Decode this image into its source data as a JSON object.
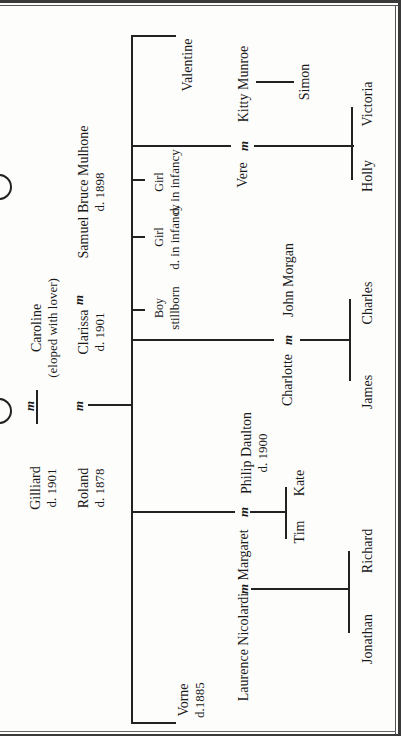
{
  "diagram": {
    "type": "family-tree",
    "orientation": "rotated-90-ccw",
    "marriage_symbol": "m",
    "generation_1": {
      "gilliard": {
        "name": "Gilliard",
        "note": "d. 1901"
      },
      "caroline": {
        "name": "Caroline",
        "note": "(eloped with lover)"
      },
      "roland": {
        "name": "Roland",
        "note": "d. 1878"
      },
      "clarissa": {
        "name": "Clarissa",
        "note": "d. 1901"
      },
      "samuel": {
        "name": "Samuel Bruce Mulhone",
        "note": "d. 1898"
      }
    },
    "generation_2": {
      "valentine": {
        "name": "Valentine"
      },
      "vere": {
        "name": "Vere"
      },
      "kitty": {
        "name": "Kitty Munroe"
      },
      "girl2": {
        "name": "Girl",
        "note": "d. in infancy"
      },
      "girl1": {
        "name": "Girl",
        "note": "d. in infancy"
      },
      "boy": {
        "name": "Boy",
        "note": "stillborn"
      },
      "charlotte": {
        "name": "Charlotte"
      },
      "john": {
        "name": "John Morgan"
      },
      "margaret": {
        "name": "Margaret"
      },
      "philip": {
        "name": "Philip Daulton",
        "note": "d. 1900"
      },
      "laurence": {
        "name": "Laurence Nicolardi"
      },
      "vorne": {
        "name": "Vorne",
        "note": "d.1885"
      }
    },
    "generation_3": {
      "simon": {
        "name": "Simon"
      },
      "victoria": {
        "name": "Victoria"
      },
      "holly": {
        "name": "Holly"
      },
      "charles": {
        "name": "Charles"
      },
      "james": {
        "name": "James"
      },
      "kate": {
        "name": "Kate"
      },
      "tim": {
        "name": "Tim"
      },
      "richard": {
        "name": "Richard"
      },
      "jonathan": {
        "name": "Jonathan"
      }
    }
  }
}
